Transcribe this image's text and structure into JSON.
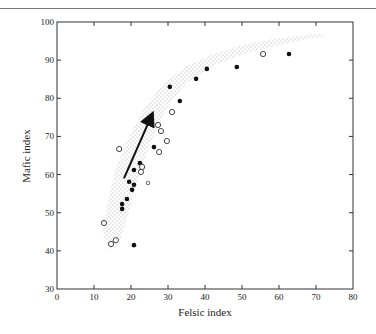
{
  "chart_data": {
    "type": "scatter",
    "title": "",
    "xlabel": "Felsic index",
    "ylabel": "Mafic index",
    "xlim": [
      0,
      80
    ],
    "ylim": [
      30,
      100
    ],
    "xticks": [
      0,
      10,
      20,
      30,
      40,
      50,
      60,
      70,
      80
    ],
    "yticks": [
      30,
      40,
      50,
      60,
      70,
      80,
      90,
      100
    ],
    "grid": false,
    "legend": null,
    "series": [
      {
        "name": "filled circles",
        "marker": "filled",
        "points": [
          [
            20.8,
            41.5
          ],
          [
            17.6,
            51.0
          ],
          [
            17.6,
            52.3
          ],
          [
            18.9,
            53.6
          ],
          [
            20.3,
            56.0
          ],
          [
            19.5,
            58.1
          ],
          [
            20.8,
            57.3
          ],
          [
            20.8,
            61.2
          ],
          [
            22.4,
            63.0
          ],
          [
            26.2,
            67.2
          ],
          [
            33.2,
            79.3
          ],
          [
            30.5,
            83.0
          ],
          [
            37.6,
            85.1
          ],
          [
            40.5,
            87.7
          ],
          [
            48.6,
            88.2
          ],
          [
            62.7,
            91.6
          ]
        ]
      },
      {
        "name": "open circles",
        "marker": "open",
        "points": [
          [
            12.7,
            47.3
          ],
          [
            15.9,
            42.8
          ],
          [
            14.6,
            41.8
          ],
          [
            23.0,
            62.0
          ],
          [
            22.7,
            60.7
          ],
          [
            16.8,
            66.7
          ],
          [
            27.6,
            65.9
          ],
          [
            29.7,
            68.8
          ],
          [
            27.3,
            73.0
          ],
          [
            28.1,
            71.4
          ],
          [
            31.1,
            76.4
          ],
          [
            55.7,
            91.6
          ]
        ]
      },
      {
        "name": "small open circles",
        "marker": "open-small",
        "points": [
          [
            24.6,
            57.8
          ]
        ]
      }
    ],
    "annotations": [
      {
        "type": "arrow",
        "from": [
          18.1,
          59.0
        ],
        "to": [
          25.7,
          75.8
        ]
      },
      {
        "type": "stippled-band",
        "description": "curved trend field from ~(13,40) to ~(72,97)"
      }
    ]
  }
}
